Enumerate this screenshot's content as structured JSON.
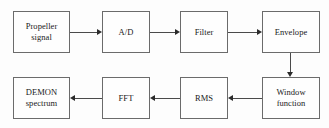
{
  "diagram": {
    "type": "flowchart",
    "canvas": {
      "width": 329,
      "height": 128,
      "background": "#fdfdfd"
    },
    "style": {
      "box_border_color": "#6b6b6b",
      "line_color": "#4a4a4a",
      "arrow_color": "#2b2b2b",
      "text_color": "#1a1a1a"
    },
    "nodes": [
      {
        "id": "propeller-signal",
        "label": "Propeller\nsignal",
        "row": "top",
        "order": 1
      },
      {
        "id": "ad",
        "label": "A/D",
        "row": "top",
        "order": 2
      },
      {
        "id": "filter",
        "label": "Filter",
        "row": "top",
        "order": 3
      },
      {
        "id": "envelope",
        "label": "Envelope",
        "row": "top",
        "order": 4
      },
      {
        "id": "window-function",
        "label": "Window\nfunction",
        "row": "bottom",
        "order": 5
      },
      {
        "id": "rms",
        "label": "RMS",
        "row": "bottom",
        "order": 6
      },
      {
        "id": "fft",
        "label": "FFT",
        "row": "bottom",
        "order": 7
      },
      {
        "id": "demon-spectrum",
        "label": "DEMON\nspectrum",
        "row": "bottom",
        "order": 8
      }
    ],
    "edges": [
      {
        "id": "edge-1",
        "from": "propeller-signal",
        "to": "ad",
        "direction": "right"
      },
      {
        "id": "edge-2",
        "from": "ad",
        "to": "filter",
        "direction": "right"
      },
      {
        "id": "edge-3",
        "from": "filter",
        "to": "envelope",
        "direction": "right"
      },
      {
        "id": "edge-4",
        "from": "envelope",
        "to": "window-function",
        "direction": "down"
      },
      {
        "id": "edge-5",
        "from": "window-function",
        "to": "rms",
        "direction": "left"
      },
      {
        "id": "edge-6",
        "from": "rms",
        "to": "fft",
        "direction": "left"
      },
      {
        "id": "edge-7",
        "from": "fft",
        "to": "demon-spectrum",
        "direction": "left"
      }
    ]
  }
}
